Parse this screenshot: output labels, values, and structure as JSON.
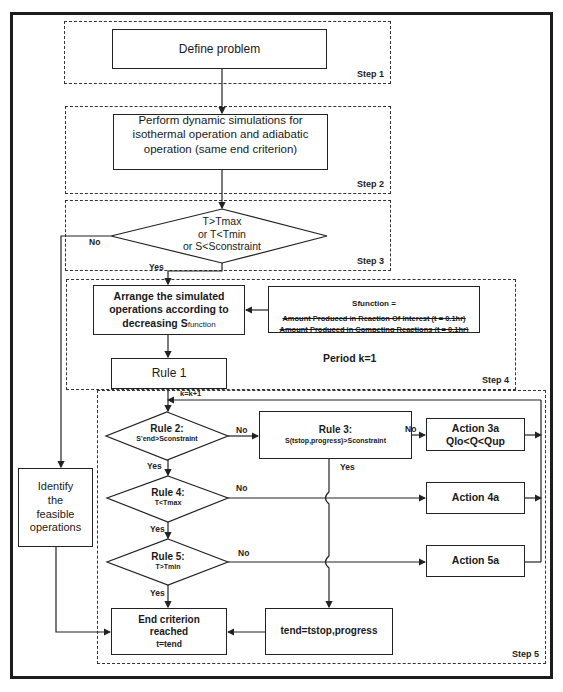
{
  "diagram": {
    "steps": [
      {
        "id": "step1",
        "label": "Step 1"
      },
      {
        "id": "step2",
        "label": "Step 2"
      },
      {
        "id": "step3",
        "label": "Step 3"
      },
      {
        "id": "step4",
        "label": "Step 4"
      },
      {
        "id": "step5",
        "label": "Step 5"
      }
    ],
    "nodes": {
      "define_problem": "Define problem",
      "perform_simulations": "Perform dynamic simulations for isothermal operation and adiabatic operation (same end criterion)",
      "step3_decision": {
        "line1": "T>Tmax",
        "line2": "or T<Tmin",
        "line3": "or S<Sconstraint"
      },
      "arrange": {
        "line1": "Arrange the simulated",
        "line2": "operations according to",
        "line3": "decreasing S",
        "sub": "function"
      },
      "sfunction": {
        "title": "Sfunction =",
        "numerator": "Amount Produced in Reaction Of Interest (t = 0.1hr)",
        "denominator": "Amount Produced in Competing Reactions (t = 0.1hr)"
      },
      "period": "Period k=1",
      "rule1": "Rule 1",
      "identify": {
        "line1": "Identify",
        "line2": "the",
        "line3": "feasible",
        "line4": "operations"
      },
      "rule2": {
        "title": "Rule 2:",
        "cond": "S'end>Sconstraint"
      },
      "rule3": {
        "title": "Rule 3:",
        "cond": "S(tstop,progress)>Sconstraint"
      },
      "action3a": {
        "line1": "Action 3a",
        "line2": "Qlo<Q<Qup"
      },
      "rule4": {
        "title": "Rule 4:",
        "cond": "T<Tmax"
      },
      "action4a": "Action 4a",
      "rule5": {
        "title": "Rule 5:",
        "cond": "T>Tmin"
      },
      "action5a": "Action 5a",
      "end_criterion": {
        "line1": "End criterion",
        "line2": "reached",
        "line3": "t=tend"
      },
      "tend": "tend=tstop,progress"
    },
    "edge_labels": {
      "no_step3": "No",
      "yes_step3": "Yes",
      "loop": "k=k+1",
      "no_rule2": "No",
      "yes_rule2": "Yes",
      "no_rule3": "No",
      "yes_rule3": "Yes",
      "no_rule4": "No",
      "yes_rule4": "Yes",
      "no_rule5": "No",
      "yes_rule5": "Yes"
    }
  }
}
